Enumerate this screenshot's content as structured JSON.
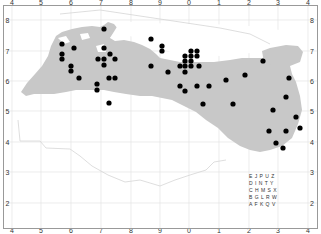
{
  "map": {
    "x_ticks": [
      {
        "label": "4",
        "x": 12
      },
      {
        "label": "5",
        "x": 41
      },
      {
        "label": "6",
        "x": 71
      },
      {
        "label": "7",
        "x": 101
      },
      {
        "label": "8",
        "x": 131
      },
      {
        "label": "9",
        "x": 160
      },
      {
        "label": "0",
        "x": 189
      },
      {
        "label": "1",
        "x": 219
      },
      {
        "label": "2",
        "x": 249
      },
      {
        "label": "3",
        "x": 278
      },
      {
        "label": "4",
        "x": 308
      }
    ],
    "y_ticks": [
      {
        "label": "8",
        "y": 20
      },
      {
        "label": "7",
        "y": 51
      },
      {
        "label": "6",
        "y": 81
      },
      {
        "label": "5",
        "y": 111
      },
      {
        "label": "4",
        "y": 142
      },
      {
        "label": "3",
        "y": 172
      },
      {
        "label": "2",
        "y": 203
      }
    ],
    "colors": {
      "land": "#c8c8c8",
      "dot": "#000000",
      "grid": "#e4e4e4",
      "coast": "#d6d6d6"
    },
    "letter_grid": [
      "E J P U Z",
      "D I N T Y",
      "C H M S X",
      "B G L R W",
      "A F K Q V"
    ],
    "points": [
      [
        62,
        44
      ],
      [
        62,
        54
      ],
      [
        62,
        59
      ],
      [
        74,
        48
      ],
      [
        71,
        66
      ],
      [
        71,
        71
      ],
      [
        79,
        78
      ],
      [
        104,
        29
      ],
      [
        104,
        48
      ],
      [
        98,
        59
      ],
      [
        104,
        59
      ],
      [
        110,
        54
      ],
      [
        104,
        65
      ],
      [
        115,
        59
      ],
      [
        97,
        84
      ],
      [
        97,
        90
      ],
      [
        109,
        78
      ],
      [
        115,
        78
      ],
      [
        109,
        103
      ],
      [
        151,
        66
      ],
      [
        151,
        39
      ],
      [
        162,
        46
      ],
      [
        162,
        51
      ],
      [
        191,
        51
      ],
      [
        197,
        51
      ],
      [
        185,
        56
      ],
      [
        191,
        56
      ],
      [
        197,
        56
      ],
      [
        185,
        61
      ],
      [
        191,
        61
      ],
      [
        180,
        66
      ],
      [
        185,
        66
      ],
      [
        191,
        66
      ],
      [
        199,
        66
      ],
      [
        168,
        72
      ],
      [
        185,
        72
      ],
      [
        180,
        86
      ],
      [
        197,
        86
      ],
      [
        209,
        86
      ],
      [
        185,
        91
      ],
      [
        226,
        80
      ],
      [
        245,
        75
      ],
      [
        203,
        104
      ],
      [
        233,
        104
      ],
      [
        263,
        61
      ],
      [
        286,
        97
      ],
      [
        273,
        110
      ],
      [
        269,
        131
      ],
      [
        296,
        117
      ],
      [
        286,
        131
      ],
      [
        300,
        128
      ],
      [
        283,
        148
      ],
      [
        276,
        143
      ],
      [
        289,
        78
      ]
    ]
  }
}
